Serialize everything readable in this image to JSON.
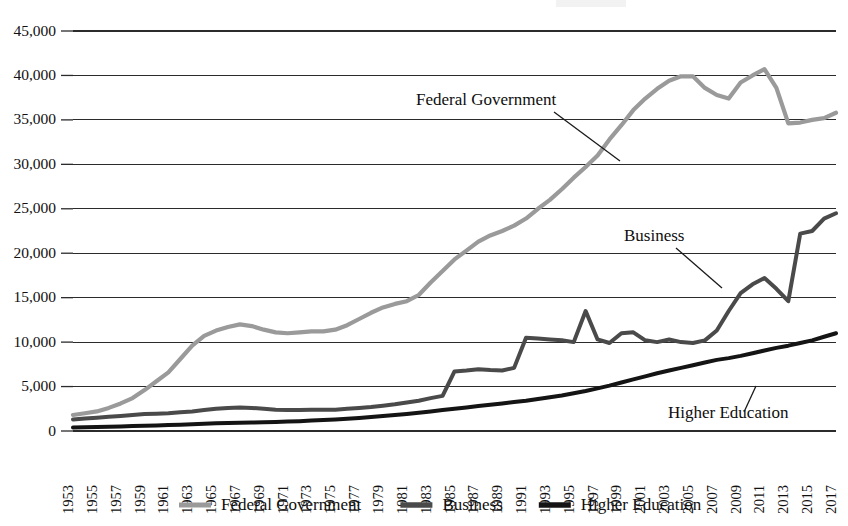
{
  "chart_data": {
    "type": "line",
    "title": "",
    "xlabel": "",
    "ylabel": "",
    "ylim": [
      0,
      45000
    ],
    "xlim": [
      1953,
      2017
    ],
    "grid": true,
    "legend_position": "bottom",
    "ytick_labels": [
      "45,000",
      "40,000",
      "35,000",
      "30,000",
      "25,000",
      "20,000",
      "15,000",
      "10,000",
      "5,000",
      "0"
    ],
    "ytick_values": [
      45000,
      40000,
      35000,
      30000,
      25000,
      20000,
      15000,
      10000,
      5000,
      0
    ],
    "xtick_labels": [
      "1953",
      "1955",
      "1957",
      "1959",
      "1961",
      "1963",
      "1965",
      "1967",
      "1969",
      "1971",
      "1973",
      "1975",
      "1977",
      "1979",
      "1981",
      "1983",
      "1985",
      "1987",
      "1989",
      "1991",
      "1993",
      "1995",
      "1997",
      "1999",
      "2001",
      "2003",
      "2005",
      "2007",
      "2009",
      "2011",
      "2013",
      "2015",
      "2017"
    ],
    "x": [
      1953,
      1954,
      1955,
      1956,
      1957,
      1958,
      1959,
      1960,
      1961,
      1962,
      1963,
      1964,
      1965,
      1966,
      1967,
      1968,
      1969,
      1970,
      1971,
      1972,
      1973,
      1974,
      1975,
      1976,
      1977,
      1978,
      1979,
      1980,
      1981,
      1982,
      1983,
      1984,
      1985,
      1986,
      1987,
      1988,
      1989,
      1990,
      1991,
      1992,
      1993,
      1994,
      1995,
      1996,
      1997,
      1998,
      1999,
      2000,
      2001,
      2002,
      2003,
      2004,
      2005,
      2006,
      2007,
      2008,
      2009,
      2010,
      2011,
      2012,
      2013,
      2014,
      2015,
      2016,
      2017
    ],
    "series": [
      {
        "name": "Federal Government",
        "color": "#9a9a9a",
        "values": [
          1800,
          2000,
          2200,
          2600,
          3100,
          3700,
          4600,
          5600,
          6600,
          8100,
          9600,
          10700,
          11300,
          11700,
          12000,
          11800,
          11400,
          11100,
          11000,
          11100,
          11200,
          11200,
          11400,
          11900,
          12600,
          13300,
          13900,
          14300,
          14600,
          15300,
          16700,
          18000,
          19300,
          20300,
          21300,
          22000,
          22500,
          23100,
          23900,
          25000,
          26000,
          27200,
          28500,
          29700,
          31000,
          32800,
          34400,
          36100,
          37400,
          38500,
          39400,
          39900,
          39900,
          38600,
          37800,
          37400,
          39200,
          40000,
          40700,
          38600,
          34600,
          34700,
          35000,
          35200,
          35800
        ]
      },
      {
        "name": "Business",
        "color": "#4a4a4a",
        "values": [
          1300,
          1400,
          1500,
          1600,
          1700,
          1800,
          1900,
          1950,
          2000,
          2100,
          2200,
          2350,
          2500,
          2600,
          2650,
          2600,
          2500,
          2400,
          2350,
          2350,
          2400,
          2400,
          2400,
          2500,
          2600,
          2700,
          2850,
          3000,
          3200,
          3400,
          3700,
          3950,
          6700,
          6800,
          6950,
          6850,
          6800,
          7100,
          10500,
          10400,
          10300,
          10200,
          10000,
          13500,
          10300,
          9900,
          11000,
          11100,
          10200,
          10000,
          10300,
          10000,
          9900,
          10200,
          11300,
          13500,
          15500,
          16500,
          17200,
          16000,
          14600,
          22200,
          22500,
          23900,
          24500
        ]
      },
      {
        "name": "Higher Education",
        "color": "#141414",
        "values": [
          400,
          420,
          450,
          480,
          510,
          550,
          590,
          630,
          670,
          710,
          760,
          810,
          860,
          900,
          930,
          960,
          990,
          1020,
          1060,
          1110,
          1170,
          1230,
          1300,
          1380,
          1470,
          1570,
          1680,
          1800,
          1920,
          2050,
          2200,
          2350,
          2500,
          2650,
          2800,
          2950,
          3100,
          3250,
          3400,
          3600,
          3800,
          4000,
          4250,
          4500,
          4800,
          5100,
          5450,
          5800,
          6150,
          6500,
          6800,
          7100,
          7400,
          7700,
          8000,
          8200,
          8450,
          8750,
          9050,
          9350,
          9600,
          9900,
          10200,
          10600,
          11000
        ]
      }
    ],
    "annotations": [
      {
        "label": "Federal Government",
        "x_px": 416,
        "y_px": 105
      },
      {
        "label": "Business",
        "x_px": 624,
        "y_px": 241
      },
      {
        "label": "Higher Education",
        "x_px": 668,
        "y_px": 418
      }
    ]
  },
  "legend": {
    "items": [
      {
        "label": "Federal Government",
        "color": "#9a9a9a"
      },
      {
        "label": "Business",
        "color": "#4a4a4a"
      },
      {
        "label": "Higher Education",
        "color": "#141414"
      }
    ]
  }
}
